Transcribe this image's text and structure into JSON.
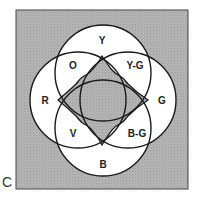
{
  "figure": {
    "panel_label": "C",
    "colors": {
      "background_fill": "#b3b3b3",
      "circle_fill": "#ffffff",
      "stroke": "#1a1a1a",
      "center_fill": "#b0b0b0"
    },
    "regions": {
      "top": "Y",
      "top_left": "O",
      "top_right": "Y-G",
      "left": "R",
      "right": "G",
      "bottom_left": "V",
      "bottom_right": "B-G",
      "bottom": "B"
    }
  }
}
